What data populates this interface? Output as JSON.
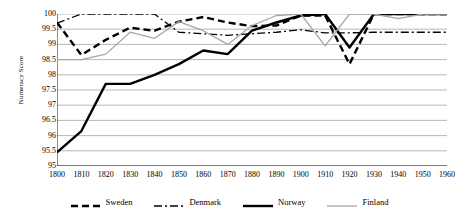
{
  "chart_data": {
    "type": "line",
    "title": "",
    "xlabel": "",
    "ylabel": "Numeracy Score",
    "x": [
      1800,
      1810,
      1820,
      1830,
      1840,
      1850,
      1860,
      1870,
      1880,
      1890,
      1900,
      1910,
      1920,
      1930,
      1940,
      1950,
      1960
    ],
    "xlim": [
      1800,
      1960
    ],
    "ylim": [
      95,
      100
    ],
    "y_ticks": [
      "100",
      "99.5",
      "99",
      "98.5",
      "98",
      "97.5",
      "97",
      "96.5",
      "96",
      "95.5",
      "95"
    ],
    "y_tick_values": [
      100,
      99.5,
      99,
      98.5,
      98,
      97.5,
      97,
      96.5,
      96,
      95.5,
      95
    ],
    "x_ticks": [
      "1800",
      "1810",
      "1820",
      "1830",
      "1840",
      "1850",
      "1860",
      "1870",
      "1880",
      "1890",
      "1900",
      "1910",
      "1920",
      "1930",
      "1940",
      "1950",
      "1960"
    ],
    "grid": true,
    "legend_position": "bottom",
    "series": [
      {
        "name": "Sweden",
        "style": "dashed",
        "color": "#000000",
        "width": 2.4,
        "dash": "7,4",
        "values": [
          99.72,
          98.65,
          99.15,
          99.55,
          99.45,
          99.75,
          99.9,
          99.72,
          99.6,
          99.62,
          99.95,
          99.95,
          98.35,
          100,
          100,
          100,
          100
        ]
      },
      {
        "name": "Denmark",
        "style": "dash-dot",
        "color": "#000000",
        "width": 1.3,
        "dash": "8,3,2,3",
        "values": [
          99.7,
          100,
          100,
          100,
          100,
          99.4,
          99.35,
          99.3,
          99.35,
          99.4,
          99.48,
          99.38,
          99.38,
          99.4,
          99.4,
          99.4,
          99.4
        ]
      },
      {
        "name": "Norway",
        "style": "solid",
        "color": "#000000",
        "width": 2.4,
        "dash": "none",
        "values": [
          95.45,
          96.15,
          97.7,
          97.7,
          98.0,
          98.35,
          98.8,
          98.68,
          99.45,
          99.72,
          99.95,
          100,
          98.9,
          100,
          100,
          100,
          100
        ]
      },
      {
        "name": "Finland",
        "style": "solid-thin",
        "color": "#a6a6a6",
        "width": 1.3,
        "dash": "none",
        "values": [
          98.5,
          98.5,
          98.68,
          99.4,
          99.2,
          99.75,
          99.45,
          99.0,
          99.62,
          99.95,
          100,
          98.95,
          100,
          100,
          99.85,
          100,
          100
        ]
      }
    ]
  },
  "legend": {
    "items": [
      {
        "label": "Sweden"
      },
      {
        "label": "Denmark"
      },
      {
        "label": "Norway"
      },
      {
        "label": "Finland"
      }
    ]
  }
}
